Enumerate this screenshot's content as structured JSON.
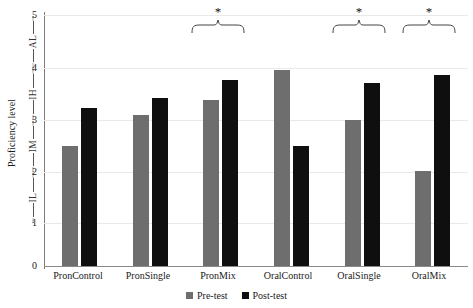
{
  "chart_data": {
    "type": "bar",
    "title": "",
    "xlabel": "",
    "ylabel": "Proficiency level",
    "ylim": [
      0,
      5
    ],
    "yticks": [
      0,
      1,
      2,
      3,
      4,
      5
    ],
    "grid": true,
    "legend_position": "bottom",
    "categories": [
      "PronControl",
      "PronSingle",
      "PronMix",
      "OralControl",
      "OralSingle",
      "OralMix"
    ],
    "series": [
      {
        "name": "Pre-test",
        "color": "#6e6e6e",
        "values": [
          2.4,
          3.0,
          3.3,
          3.9,
          2.9,
          1.9
        ]
      },
      {
        "name": "Post-test",
        "color": "#0f0f0f",
        "values": [
          3.15,
          3.35,
          3.7,
          2.4,
          3.65,
          3.8
        ]
      }
    ],
    "band_labels": [
      {
        "label": "IL",
        "from": 1,
        "to": 2
      },
      {
        "label": "IM",
        "from": 2,
        "to": 3
      },
      {
        "label": "IH",
        "from": 3,
        "to": 4
      },
      {
        "label": "AL",
        "from": 4,
        "to": 5
      }
    ],
    "annotations": [
      {
        "marker": "*",
        "category": "PronMix"
      },
      {
        "marker": "*",
        "category": "OralSingle"
      },
      {
        "marker": "*",
        "category": "OralMix"
      }
    ]
  },
  "axis": {
    "y_title": "Proficiency level",
    "tick_5": "5",
    "tick_4": "4",
    "tick_3": "3",
    "tick_2": "2",
    "tick_1": "1",
    "tick_0": "0"
  },
  "bands": {
    "al": "AL",
    "ih": "IH",
    "im": "IM",
    "il": "IL"
  },
  "xlabels": {
    "c0": "PronControl",
    "c1": "PronSingle",
    "c2": "PronMix",
    "c3": "OralControl",
    "c4": "OralSingle",
    "c5": "OralMix"
  },
  "significance": {
    "s0": "*",
    "s1": "*",
    "s2": "*"
  },
  "legend": {
    "pre": "Pre-test",
    "post": "Post-test"
  }
}
